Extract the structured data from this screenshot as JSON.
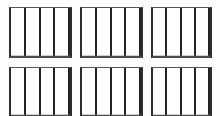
{
  "figure": {
    "title": "",
    "background_color": "#fdfdfd",
    "panel_fill_color": "#ffffff",
    "panel_border_color": "#2e2e2e",
    "divider_color": "#232323",
    "layout": {
      "rows": 2,
      "columns": 3,
      "panel_count": 6,
      "cells_per_panel": 4
    }
  },
  "panels": [
    {
      "name": "panel-1",
      "row": 1,
      "column": 1,
      "cells": [
        {
          "name": "cell-1",
          "label": ""
        },
        {
          "name": "cell-2",
          "label": ""
        },
        {
          "name": "cell-3",
          "label": ""
        },
        {
          "name": "cell-4",
          "label": ""
        }
      ]
    },
    {
      "name": "panel-2",
      "row": 1,
      "column": 2,
      "cells": [
        {
          "name": "cell-1",
          "label": ""
        },
        {
          "name": "cell-2",
          "label": ""
        },
        {
          "name": "cell-3",
          "label": ""
        },
        {
          "name": "cell-4",
          "label": ""
        }
      ]
    },
    {
      "name": "panel-3",
      "row": 1,
      "column": 3,
      "cells": [
        {
          "name": "cell-1",
          "label": ""
        },
        {
          "name": "cell-2",
          "label": ""
        },
        {
          "name": "cell-3",
          "label": ""
        },
        {
          "name": "cell-4",
          "label": ""
        }
      ]
    },
    {
      "name": "panel-4",
      "row": 2,
      "column": 1,
      "cells": [
        {
          "name": "cell-1",
          "label": ""
        },
        {
          "name": "cell-2",
          "label": ""
        },
        {
          "name": "cell-3",
          "label": ""
        },
        {
          "name": "cell-4",
          "label": ""
        }
      ]
    },
    {
      "name": "panel-5",
      "row": 2,
      "column": 2,
      "cells": [
        {
          "name": "cell-1",
          "label": ""
        },
        {
          "name": "cell-2",
          "label": ""
        },
        {
          "name": "cell-3",
          "label": ""
        },
        {
          "name": "cell-4",
          "label": ""
        }
      ]
    },
    {
      "name": "panel-6",
      "row": 2,
      "column": 3,
      "cells": [
        {
          "name": "cell-1",
          "label": ""
        },
        {
          "name": "cell-2",
          "label": ""
        },
        {
          "name": "cell-3",
          "label": ""
        },
        {
          "name": "cell-4",
          "label": ""
        }
      ]
    }
  ]
}
